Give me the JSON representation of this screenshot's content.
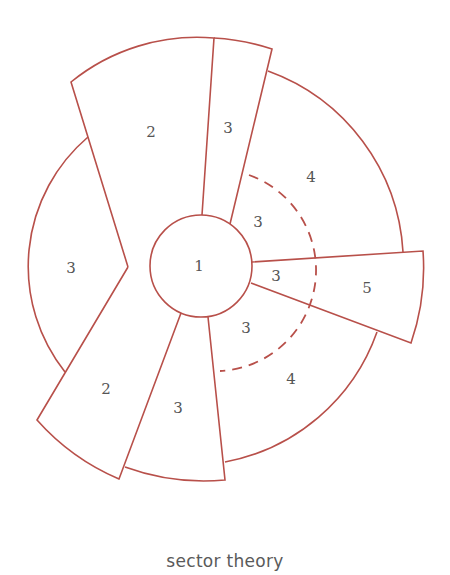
{
  "diagram": {
    "title": "sector theory",
    "stroke_color": "#b8504a",
    "text_color": "#555555",
    "zones": [
      {
        "id": "center",
        "label": "1"
      },
      {
        "id": "upper-left-wedge",
        "label": "2"
      },
      {
        "id": "upper-narrow-wedge",
        "label": "3"
      },
      {
        "id": "upper-right-sector",
        "label": "4"
      },
      {
        "id": "inner-upper-right",
        "label": "3"
      },
      {
        "id": "inner-right",
        "label": "3"
      },
      {
        "id": "right-wedge",
        "label": "5"
      },
      {
        "id": "inner-lower-right",
        "label": "3"
      },
      {
        "id": "lower-right-sector",
        "label": "4"
      },
      {
        "id": "lower-wedge",
        "label": "3"
      },
      {
        "id": "lower-left-wedge",
        "label": "2"
      },
      {
        "id": "left-sector",
        "label": "3"
      }
    ]
  }
}
